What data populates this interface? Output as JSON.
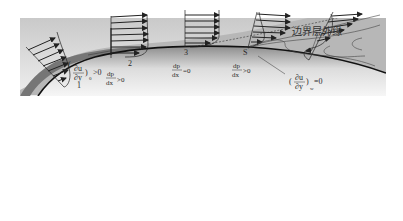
{
  "diagram": {
    "outer_edge_label": "边界层外缘",
    "stations": [
      {
        "id": "1",
        "label": "1"
      },
      {
        "id": "2",
        "label": "2"
      },
      {
        "id": "3",
        "label": "3"
      },
      {
        "id": "S",
        "label": "S"
      }
    ],
    "pressure_gradients": [
      {
        "num": "dp",
        "den": "dx",
        "rel": ">0"
      },
      {
        "num": "dp",
        "den": "dx",
        "rel": "=0"
      },
      {
        "num": "dp",
        "den": "dx",
        "rel": ">0"
      }
    ],
    "wall_shear_labels": [
      {
        "num": "∂u",
        "den": "∂y",
        "sub": "0",
        "rel": ">0"
      },
      {
        "num": "∂u",
        "den": "∂y",
        "sub": "w",
        "rel": "=0"
      }
    ],
    "colors": {
      "freestream": "#e4e4e4",
      "boundary_layer": "#b4b4b4",
      "wall_band": "#7a7a7a",
      "body_top": "#d0d0d0",
      "body_bottom": "#f2f2f2",
      "lines": "#222222"
    }
  }
}
